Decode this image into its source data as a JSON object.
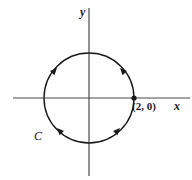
{
  "figure": {
    "type": "cartesian-plane-with-oriented-circle",
    "background_color": "#ffffff",
    "stroke_color": "#1a1a1a",
    "axis_color": "#4a4a4a",
    "axes": {
      "x_label": "x",
      "y_label": "y",
      "x_axis": {
        "y_pixel": 98,
        "x_start": 13,
        "x_end": 190
      },
      "y_axis": {
        "x_pixel": 89,
        "y_start": 8,
        "y_end": 176
      },
      "origin": {
        "x": 89,
        "y": 98
      }
    },
    "curve": {
      "label": "C",
      "shape": "circle",
      "center": {
        "x": 89,
        "y": 98
      },
      "radius": 45,
      "stroke_width": 1.4,
      "orientation_marks": 4
    },
    "point": {
      "label": "(2, 0)",
      "marker": "filled-dot",
      "x_pixel": 134,
      "y_pixel": 98
    },
    "arrowheads": [
      {
        "name": "arrowhead-upper-left",
        "x": 57,
        "y": 68,
        "rotation_deg": 43
      },
      {
        "name": "arrowhead-upper-right",
        "x": 120,
        "y": 68,
        "rotation_deg": -43
      },
      {
        "name": "arrowhead-lower-left",
        "x": 57,
        "y": 128,
        "rotation_deg": 136
      },
      {
        "name": "arrowhead-lower-right",
        "x": 120,
        "y": 128,
        "rotation_deg": -136
      }
    ]
  }
}
